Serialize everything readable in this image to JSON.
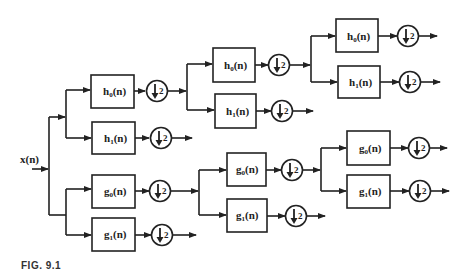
{
  "diagram": {
    "type": "wavelet-packet-analysis-filter-bank",
    "input_label": "x(n)",
    "caption": "FIG. 9.1",
    "downsample_factor": "2",
    "line_color": "#222222",
    "filters": {
      "h0": {
        "main": "h",
        "sub": "0",
        "tail": "(n)"
      },
      "h1": {
        "main": "h",
        "sub": "1",
        "tail": "(n)"
      },
      "g0": {
        "main": "g",
        "sub": "0",
        "tail": "(n)"
      },
      "g1": {
        "main": "g",
        "sub": "1",
        "tail": "(n)"
      }
    },
    "nodes": [
      {
        "id": "L1-h0",
        "filter": "h0(n)"
      },
      {
        "id": "L1-h1",
        "filter": "h1(n)"
      },
      {
        "id": "L1-g0",
        "filter": "g0(n)"
      },
      {
        "id": "L1-g1",
        "filter": "g1(n)"
      },
      {
        "id": "L2-h0",
        "filter": "h0(n)",
        "parent": "L1-h0"
      },
      {
        "id": "L2-h1",
        "filter": "h1(n)",
        "parent": "L1-h0"
      },
      {
        "id": "L2-g0",
        "filter": "g0(n)",
        "parent": "L1-g0"
      },
      {
        "id": "L2-g1",
        "filter": "g1(n)",
        "parent": "L1-g0"
      },
      {
        "id": "L3-h0",
        "filter": "h0(n)",
        "parent": "L2-h0"
      },
      {
        "id": "L3-h1",
        "filter": "h1(n)",
        "parent": "L2-h0"
      },
      {
        "id": "L3-g0",
        "filter": "g0(n)",
        "parent": "L2-g0"
      },
      {
        "id": "L3-g1",
        "filter": "g1(n)",
        "parent": "L2-g0"
      }
    ]
  }
}
